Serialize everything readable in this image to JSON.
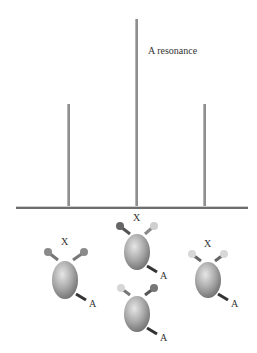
{
  "figure": {
    "annotation": "A resonance",
    "peaks": [
      {
        "name": "left-peak",
        "x": 68,
        "top": 104
      },
      {
        "name": "center-peak",
        "x": 136,
        "top": 19
      },
      {
        "name": "right-peak",
        "x": 204,
        "top": 104
      }
    ],
    "molecules": [
      {
        "name": "molecule-left",
        "x_label": "X",
        "a_label": "A"
      },
      {
        "name": "molecule-center-top",
        "x_label": "X",
        "a_label": "A"
      },
      {
        "name": "molecule-center-bottom",
        "a_label": "A"
      },
      {
        "name": "molecule-right",
        "x_label": "X",
        "a_label": "A"
      }
    ]
  }
}
